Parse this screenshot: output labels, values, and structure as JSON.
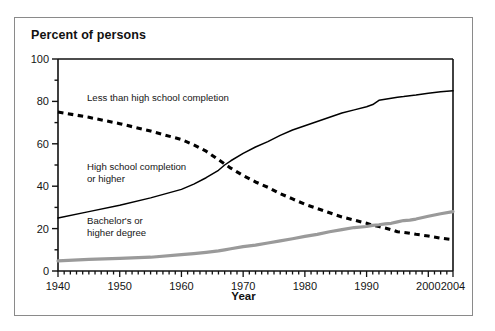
{
  "figure": {
    "title": "Percent of persons",
    "xlabel": "Year",
    "border_color": "#8a8a8a"
  },
  "annotations": {
    "less_than_hs": "Less than high school completion",
    "hs_completion_l1": "High school completion",
    "hs_completion_l2": "or higher",
    "bachelors_l1": "Bachelor's or",
    "bachelors_l2": "higher degree"
  },
  "axis": {
    "y_ticks": [
      "0",
      "20",
      "40",
      "60",
      "80",
      "100"
    ],
    "x_ticks": [
      "1940",
      "1950",
      "1960",
      "1970",
      "1980",
      "1990",
      "2000",
      "2004"
    ]
  },
  "chart_data": {
    "type": "line",
    "title": "Percent of persons",
    "xlabel": "Year",
    "ylabel": "Percent of persons",
    "xlim": [
      1940,
      2004
    ],
    "ylim": [
      0,
      100
    ],
    "grid": false,
    "legend": "inline annotations",
    "y_major_ticks": [
      0,
      20,
      40,
      60,
      80,
      100
    ],
    "y_minor_tick_step": 10,
    "x_major_ticks": [
      1940,
      1950,
      1960,
      1970,
      1980,
      1990,
      2000,
      2004
    ],
    "x_minor_tick_step": 1,
    "x": [
      1940,
      1945,
      1950,
      1955,
      1960,
      1962,
      1964,
      1966,
      1967,
      1968,
      1970,
      1972,
      1974,
      1976,
      1978,
      1980,
      1982,
      1984,
      1986,
      1988,
      1990,
      1991,
      1992,
      1993,
      1994,
      1995,
      1996,
      1997,
      1998,
      2000,
      2002,
      2004
    ],
    "series": [
      {
        "name": "Less than high school completion",
        "style": "dashed",
        "color": "#000000",
        "values": [
          75.0,
          72.5,
          69.5,
          66.0,
          62.0,
          59.5,
          56.5,
          52.5,
          50.5,
          48.5,
          45.0,
          42.0,
          39.5,
          36.5,
          34.0,
          31.5,
          29.5,
          27.5,
          25.5,
          24.0,
          22.5,
          21.5,
          21.0,
          20.3,
          19.5,
          18.5,
          18.2,
          17.8,
          17.3,
          16.5,
          15.5,
          14.8
        ]
      },
      {
        "name": "High school completion or higher",
        "style": "solid",
        "color": "#000000",
        "values": [
          25.0,
          28.0,
          31.0,
          34.5,
          38.5,
          41.0,
          44.0,
          47.5,
          50.0,
          52.0,
          55.5,
          58.5,
          61.0,
          64.0,
          66.5,
          68.5,
          70.5,
          72.5,
          74.5,
          76.0,
          77.5,
          78.5,
          80.5,
          81.0,
          81.5,
          82.0,
          82.3,
          82.7,
          83.0,
          83.8,
          84.5,
          85.0
        ]
      },
      {
        "name": "Bachelor's or higher degree",
        "style": "solid-gray",
        "color": "#9a9a9a",
        "values": [
          4.8,
          5.5,
          6.0,
          6.5,
          7.7,
          8.2,
          8.8,
          9.5,
          10.0,
          10.5,
          11.5,
          12.2,
          13.2,
          14.2,
          15.2,
          16.3,
          17.3,
          18.5,
          19.5,
          20.5,
          21.0,
          21.5,
          21.8,
          22.2,
          22.5,
          23.2,
          23.8,
          24.0,
          24.5,
          25.8,
          27.0,
          28.0
        ]
      }
    ]
  }
}
